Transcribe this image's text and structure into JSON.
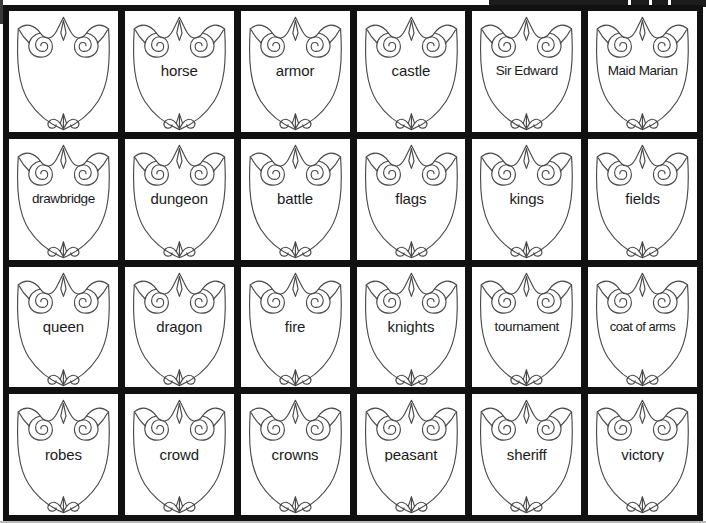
{
  "worksheet": {
    "title": "Medieval Vocabulary Shields",
    "grid": {
      "columns": 6,
      "rows": 4
    },
    "shield_icon_name": "heraldic-shield-outline",
    "colors": {
      "grid_border": "#111111",
      "cell_background": "#ffffff",
      "shield_outline": "#4a4a4a",
      "label_text": "#1b1b1b"
    },
    "cells": [
      {
        "label": ""
      },
      {
        "label": "horse"
      },
      {
        "label": "armor"
      },
      {
        "label": "castle"
      },
      {
        "label": "Sir Edward"
      },
      {
        "label": "Maid Marian"
      },
      {
        "label": "drawbridge"
      },
      {
        "label": "dungeon"
      },
      {
        "label": "battle"
      },
      {
        "label": "flags"
      },
      {
        "label": "kings"
      },
      {
        "label": "fields"
      },
      {
        "label": "queen"
      },
      {
        "label": "dragon"
      },
      {
        "label": "fire"
      },
      {
        "label": "knights"
      },
      {
        "label": "tournament"
      },
      {
        "label": "coat of arms"
      },
      {
        "label": "robes"
      },
      {
        "label": "crowd"
      },
      {
        "label": "crowns"
      },
      {
        "label": "peasant"
      },
      {
        "label": "sheriff"
      },
      {
        "label": "victory"
      }
    ]
  }
}
